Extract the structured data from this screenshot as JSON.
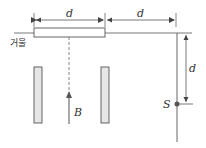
{
  "diagram": {
    "labels": {
      "mirror": "거울",
      "dim_top_left": "d",
      "dim_top_right": "d",
      "dim_vertical": "d",
      "source": "S",
      "beam": "B"
    },
    "colors": {
      "line": "#555555",
      "fill": "#e6e6e6",
      "text": "#333333"
    }
  }
}
